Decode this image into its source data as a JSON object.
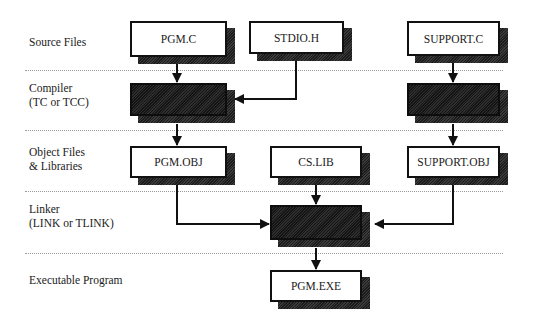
{
  "stages": [
    {
      "id": "source",
      "label": "Source Files",
      "top": 35
    },
    {
      "id": "compiler",
      "label": "Compiler\n(TC or TCC)",
      "top": 88
    },
    {
      "id": "object",
      "label": "Object Files\n& Libraries",
      "top": 152
    },
    {
      "id": "linker",
      "label": "Linker\n(LINK or TLINK)",
      "top": 209
    },
    {
      "id": "executable",
      "label": "Executable Program",
      "top": 281
    }
  ],
  "nodes": {
    "pgm_c": {
      "label": "PGM.C",
      "type": "file"
    },
    "stdio_h": {
      "label": "STDIO.H",
      "type": "file"
    },
    "support_c": {
      "label": "SUPPORT.C",
      "type": "file"
    },
    "compiler_left": {
      "label": "",
      "type": "process"
    },
    "compiler_right": {
      "label": "",
      "type": "process"
    },
    "pgm_obj": {
      "label": "PGM.OBJ",
      "type": "file"
    },
    "cs_lib": {
      "label": "CS.LIB",
      "type": "file"
    },
    "support_obj": {
      "label": "SUPPORT.OBJ",
      "type": "file"
    },
    "linker": {
      "label": "",
      "type": "process"
    },
    "pgm_exe": {
      "label": "PGM.EXE",
      "type": "file"
    }
  },
  "edges": [
    {
      "from": "PGM.C",
      "to": "Compiler (left)"
    },
    {
      "from": "STDIO.H",
      "to": "Compiler (left)"
    },
    {
      "from": "SUPPORT.C",
      "to": "Compiler (right)"
    },
    {
      "from": "Compiler (left)",
      "to": "PGM.OBJ"
    },
    {
      "from": "Compiler (right)",
      "to": "SUPPORT.OBJ"
    },
    {
      "from": "PGM.OBJ",
      "to": "Linker"
    },
    {
      "from": "CS.LIB",
      "to": "Linker"
    },
    {
      "from": "SUPPORT.OBJ",
      "to": "Linker"
    },
    {
      "from": "Linker",
      "to": "PGM.EXE"
    }
  ]
}
